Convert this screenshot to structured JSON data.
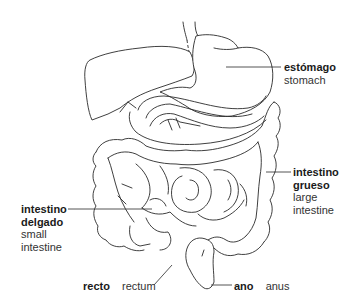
{
  "diagram": {
    "line_color": "#2a2a2a",
    "background": "#ffffff"
  },
  "labels": {
    "stomach": {
      "es": "estómago",
      "en": "stomach"
    },
    "large_intestine": {
      "es_line1": "intestino",
      "es_line2": "grueso",
      "en_line1": "large",
      "en_line2": "intestine"
    },
    "small_intestine": {
      "es_line1": "intestino",
      "es_line2": "delgado",
      "en_line1": "small",
      "en_line2": "intestine"
    },
    "rectum": {
      "es": "recto",
      "en": "rectum"
    },
    "anus": {
      "es": "ano",
      "en": "anus"
    }
  }
}
